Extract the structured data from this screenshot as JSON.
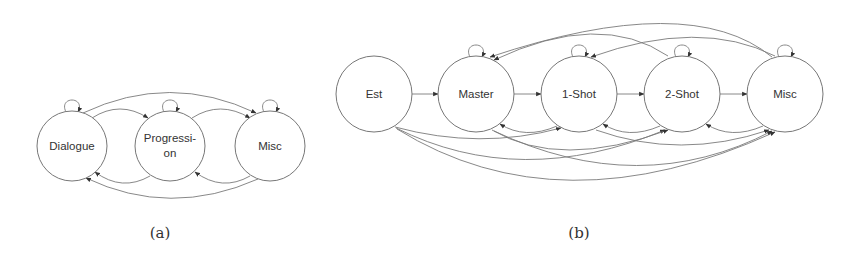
{
  "diagram_a": {
    "caption": "(a)",
    "nodes": [
      {
        "id": "dialogue",
        "label_line1": "Dialogue",
        "label_line2": ""
      },
      {
        "id": "progression",
        "label_line1": "Progressi-",
        "label_line2": "on"
      },
      {
        "id": "misc",
        "label_line1": "Misc",
        "label_line2": ""
      }
    ],
    "edges": [
      [
        "dialogue",
        "dialogue"
      ],
      [
        "progression",
        "progression"
      ],
      [
        "misc",
        "misc"
      ],
      [
        "dialogue",
        "progression"
      ],
      [
        "progression",
        "misc"
      ],
      [
        "dialogue",
        "misc"
      ],
      [
        "progression",
        "dialogue"
      ],
      [
        "misc",
        "progression"
      ],
      [
        "misc",
        "dialogue"
      ]
    ]
  },
  "diagram_b": {
    "caption": "(b)",
    "nodes": [
      {
        "id": "est",
        "label": "Est"
      },
      {
        "id": "master",
        "label": "Master"
      },
      {
        "id": "one_shot",
        "label": "1-Shot"
      },
      {
        "id": "two_shot",
        "label": "2-Shot"
      },
      {
        "id": "misc",
        "label": "Misc"
      }
    ],
    "edges": [
      [
        "master",
        "master"
      ],
      [
        "one_shot",
        "one_shot"
      ],
      [
        "two_shot",
        "two_shot"
      ],
      [
        "misc",
        "misc"
      ],
      [
        "est",
        "master"
      ],
      [
        "master",
        "one_shot"
      ],
      [
        "one_shot",
        "two_shot"
      ],
      [
        "two_shot",
        "misc"
      ],
      [
        "est",
        "one_shot"
      ],
      [
        "est",
        "two_shot"
      ],
      [
        "est",
        "misc"
      ],
      [
        "master",
        "two_shot"
      ],
      [
        "master",
        "misc"
      ],
      [
        "one_shot",
        "misc"
      ],
      [
        "one_shot",
        "master"
      ],
      [
        "two_shot",
        "one_shot"
      ],
      [
        "misc",
        "two_shot"
      ],
      [
        "two_shot",
        "master"
      ],
      [
        "misc",
        "master"
      ],
      [
        "misc",
        "one_shot"
      ]
    ]
  }
}
